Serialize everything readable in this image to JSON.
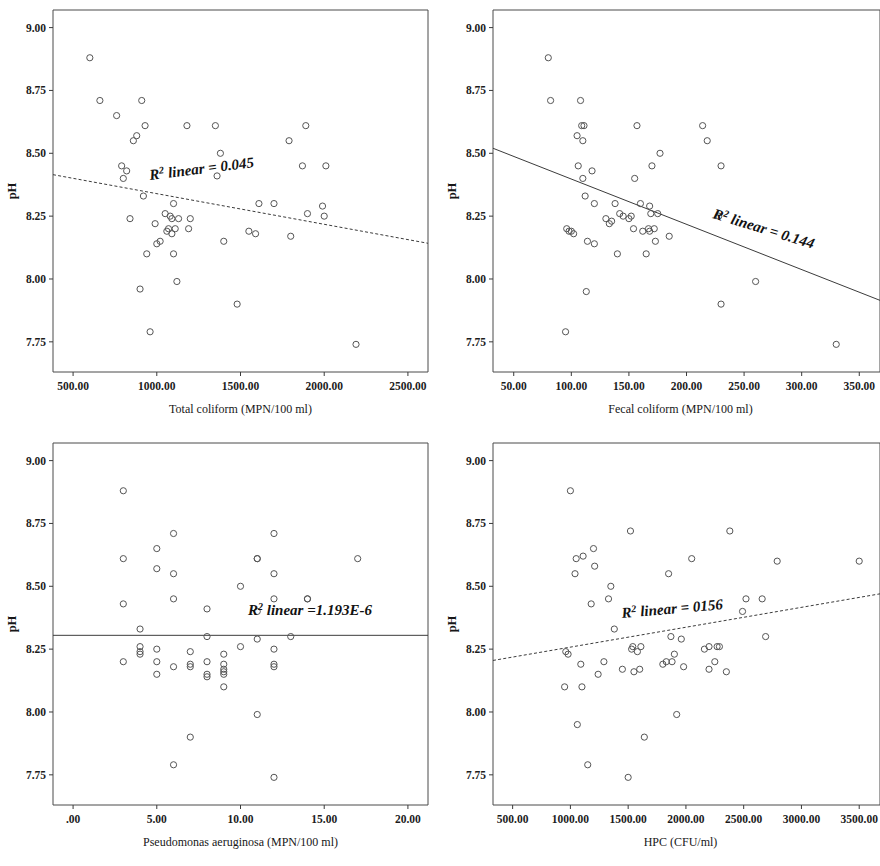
{
  "figure": {
    "kind": "four-panel-scatter-matrix",
    "y_axis_label": "pH",
    "y_ticks": [
      "7.75",
      "8.00",
      "8.25",
      "8.50",
      "8.75",
      "9.00"
    ],
    "y_tick_values": [
      7.75,
      8.0,
      8.25,
      8.5,
      8.75,
      9.0
    ],
    "ylim": [
      7.63,
      9.07
    ],
    "marker_style": "open-circle",
    "marker_color": "#555555",
    "line_color": "#3b3b3b",
    "frame_color": "#4a4a4a",
    "background": "#ffffff"
  },
  "chart_data": [
    {
      "type": "scatter",
      "panel": "top-left",
      "title": "",
      "xlabel": "Total coliform (MPN/100 ml)",
      "ylabel": "pH",
      "annotation": "R² linear = 0.045",
      "annotation_prefix": "R",
      "annotation_sup": "2",
      "annotation_suffix": " linear = 0.045",
      "r_squared": 0.045,
      "xlim": [
        380,
        2620
      ],
      "ylim": [
        7.63,
        9.07
      ],
      "x_ticks": [
        "500.00",
        "1000.00",
        "1500.00",
        "2000.00",
        "2500.00"
      ],
      "x_tick_values": [
        500,
        1000,
        1500,
        2000,
        2500
      ],
      "grid": false,
      "fit_line": {
        "style": "dashed",
        "x0": 380,
        "y0": 8.415,
        "x1": 2620,
        "y1": 8.142
      },
      "x": [
        600,
        660,
        760,
        790,
        800,
        820,
        840,
        860,
        880,
        900,
        910,
        920,
        930,
        940,
        960,
        990,
        1000,
        1020,
        1050,
        1060,
        1070,
        1080,
        1090,
        1090,
        1100,
        1100,
        1110,
        1120,
        1130,
        1180,
        1190,
        1200,
        1350,
        1360,
        1380,
        1400,
        1480,
        1550,
        1590,
        1610,
        1700,
        1790,
        1800,
        1870,
        1890,
        1900,
        1990,
        2000,
        2010,
        2190
      ],
      "y": [
        8.88,
        8.71,
        8.65,
        8.45,
        8.4,
        8.43,
        8.24,
        8.55,
        8.57,
        7.96,
        8.71,
        8.33,
        8.61,
        8.1,
        7.79,
        8.22,
        8.14,
        8.15,
        8.26,
        8.19,
        8.2,
        8.25,
        8.18,
        8.24,
        8.3,
        8.1,
        8.2,
        7.99,
        8.24,
        8.61,
        8.2,
        8.24,
        8.61,
        8.41,
        8.5,
        8.15,
        7.9,
        8.19,
        8.18,
        8.3,
        8.3,
        8.55,
        8.17,
        8.45,
        8.61,
        8.26,
        8.29,
        8.25,
        8.45,
        7.74
      ]
    },
    {
      "type": "scatter",
      "panel": "top-right",
      "title": "",
      "xlabel": "Fecal coliform (MPN/100 ml)",
      "ylabel": "pH",
      "annotation": "R² linear = 0.144",
      "annotation_prefix": "R",
      "annotation_sup": "2",
      "annotation_suffix": " linear = 0.144",
      "r_squared": 0.144,
      "xlim": [
        32,
        368
      ],
      "ylim": [
        7.63,
        9.07
      ],
      "x_ticks": [
        "50.00",
        "100.00",
        "150.00",
        "200.00",
        "250.00",
        "300.00",
        "350.00"
      ],
      "x_tick_values": [
        50,
        100,
        150,
        200,
        250,
        300,
        350
      ],
      "grid": false,
      "fit_line": {
        "style": "solid",
        "x0": 32,
        "y0": 8.52,
        "x1": 368,
        "y1": 7.915
      },
      "x": [
        80,
        82,
        95,
        96,
        98,
        100,
        102,
        105,
        106,
        108,
        109,
        110,
        110,
        111,
        112,
        113,
        114,
        118,
        120,
        120,
        130,
        133,
        135,
        138,
        140,
        142,
        145,
        150,
        152,
        154,
        155,
        157,
        160,
        162,
        165,
        167,
        168,
        168,
        169,
        170,
        172,
        173,
        175,
        177,
        185,
        214,
        218,
        228,
        230,
        230,
        260,
        330
      ],
      "y": [
        8.88,
        8.71,
        7.79,
        8.2,
        8.19,
        8.19,
        8.18,
        8.57,
        8.45,
        8.71,
        8.61,
        8.4,
        8.55,
        8.61,
        8.33,
        7.95,
        8.15,
        8.43,
        8.14,
        8.3,
        8.24,
        8.22,
        8.23,
        8.3,
        8.1,
        8.26,
        8.25,
        8.24,
        8.25,
        8.2,
        8.4,
        8.61,
        8.3,
        8.19,
        8.1,
        8.2,
        8.29,
        8.19,
        8.26,
        8.45,
        8.2,
        8.15,
        8.26,
        8.5,
        8.17,
        8.61,
        8.55,
        8.25,
        7.9,
        8.45,
        7.99,
        7.74
      ]
    },
    {
      "type": "scatter",
      "panel": "bottom-left",
      "title": "",
      "xlabel": "Pseudomonas aeruginosa (MPN/100 ml)",
      "ylabel": "pH",
      "annotation": "R² linear =1.193E-6",
      "annotation_prefix": "R",
      "annotation_sup": "2",
      "annotation_suffix": " linear =1.193E-6",
      "r_squared": 1.193e-06,
      "xlim": [
        -1.2,
        21.2
      ],
      "ylim": [
        7.63,
        9.07
      ],
      "x_ticks": [
        ".00",
        "5.00",
        "10.00",
        "15.00",
        "20.00"
      ],
      "x_tick_values": [
        0,
        5,
        10,
        15,
        20
      ],
      "grid": false,
      "fit_line": {
        "style": "solid",
        "x0": -1.2,
        "y0": 8.305,
        "x1": 21.2,
        "y1": 8.305
      },
      "x": [
        3,
        3,
        3,
        3,
        4,
        4,
        4,
        4,
        5,
        5,
        5,
        5,
        5,
        6,
        6,
        6,
        6,
        6,
        7,
        7,
        7,
        7,
        8,
        8,
        8,
        8,
        8,
        9,
        9,
        9,
        9,
        9,
        9,
        10,
        10,
        11,
        11,
        11,
        11,
        11,
        12,
        12,
        12,
        12,
        12,
        12,
        12,
        13,
        14,
        14,
        17
      ],
      "y": [
        8.88,
        8.61,
        8.43,
        8.2,
        8.33,
        8.26,
        8.24,
        8.23,
        8.65,
        8.57,
        8.25,
        8.2,
        8.15,
        8.71,
        8.55,
        8.45,
        8.18,
        7.79,
        8.24,
        8.19,
        8.18,
        7.9,
        8.41,
        8.3,
        8.2,
        8.15,
        8.14,
        8.23,
        8.19,
        8.17,
        8.16,
        8.15,
        8.1,
        8.5,
        8.26,
        8.61,
        8.61,
        8.4,
        8.29,
        7.99,
        8.71,
        8.55,
        8.45,
        8.25,
        8.19,
        8.18,
        7.74,
        8.3,
        8.45,
        8.45,
        8.61
      ]
    },
    {
      "type": "scatter",
      "panel": "bottom-right",
      "title": "",
      "xlabel": "HPC (CFU/ml)",
      "ylabel": "pH",
      "annotation": "R² linear = 0156",
      "annotation_prefix": "R",
      "annotation_sup": "2",
      "annotation_suffix": " linear = 0156",
      "r_squared": 0.156,
      "xlim": [
        330,
        3680
      ],
      "ylim": [
        7.63,
        9.07
      ],
      "x_ticks": [
        "500.00",
        "1000.00",
        "1500.00",
        "2000.00",
        "2500.00",
        "3000.00",
        "3500.00"
      ],
      "x_tick_values": [
        500,
        1000,
        1500,
        2000,
        2500,
        3000,
        3500
      ],
      "grid": false,
      "fit_line": {
        "style": "dashed",
        "x0": 330,
        "y0": 8.205,
        "x1": 3680,
        "y1": 8.47
      },
      "x": [
        950,
        960,
        980,
        1000,
        1040,
        1050,
        1060,
        1090,
        1100,
        1110,
        1150,
        1180,
        1200,
        1210,
        1240,
        1290,
        1330,
        1350,
        1380,
        1450,
        1500,
        1520,
        1530,
        1540,
        1550,
        1580,
        1600,
        1610,
        1640,
        1800,
        1830,
        1850,
        1870,
        1880,
        1900,
        1920,
        1960,
        1980,
        2050,
        2160,
        2200,
        2200,
        2250,
        2270,
        2290,
        2350,
        2380,
        2490,
        2520,
        2660,
        2690,
        2790,
        3500
      ],
      "y": [
        8.1,
        8.24,
        8.23,
        8.88,
        8.55,
        8.61,
        7.95,
        8.19,
        8.1,
        8.62,
        7.79,
        8.43,
        8.65,
        8.58,
        8.15,
        8.2,
        8.45,
        8.5,
        8.33,
        8.17,
        7.74,
        8.72,
        8.25,
        8.26,
        8.16,
        8.24,
        8.17,
        8.26,
        7.9,
        8.19,
        8.2,
        8.55,
        8.3,
        8.2,
        8.23,
        7.99,
        8.29,
        8.18,
        8.61,
        8.25,
        8.17,
        8.26,
        8.2,
        8.26,
        8.26,
        8.16,
        8.72,
        8.4,
        8.45,
        8.45,
        8.3,
        8.6,
        8.6
      ]
    }
  ]
}
